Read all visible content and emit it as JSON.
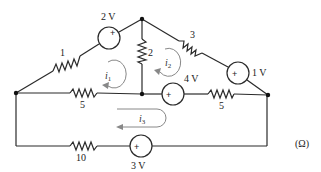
{
  "diagram": {
    "type": "circuit",
    "unit_label": "(Ω)",
    "resistors": [
      {
        "id": "R1",
        "label": "1"
      },
      {
        "id": "R2",
        "label": "2"
      },
      {
        "id": "R3",
        "label": "3"
      },
      {
        "id": "R5a",
        "label": "5"
      },
      {
        "id": "R5b",
        "label": "5"
      },
      {
        "id": "R10",
        "label": "10"
      }
    ],
    "sources": [
      {
        "id": "V2",
        "label": "2 V",
        "polarity": "+"
      },
      {
        "id": "V1",
        "label": "1 V",
        "polarity": "+"
      },
      {
        "id": "V4",
        "label": "4 V",
        "polarity": "+"
      },
      {
        "id": "V3",
        "label": "3 V",
        "polarity": "+"
      }
    ],
    "mesh_currents": [
      {
        "id": "i1",
        "symbol": "i",
        "subscript": "1",
        "direction": "counterclockwise"
      },
      {
        "id": "i2",
        "symbol": "i",
        "subscript": "2",
        "direction": "counterclockwise"
      },
      {
        "id": "i3",
        "symbol": "i",
        "subscript": "3",
        "direction": "counterclockwise"
      }
    ]
  }
}
